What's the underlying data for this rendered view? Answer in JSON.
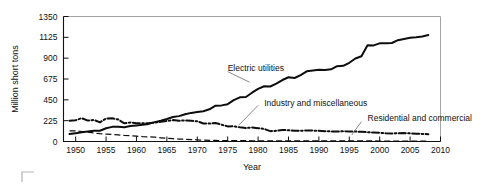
{
  "chart_data": {
    "type": "line",
    "title": "",
    "xlabel": "Year",
    "ylabel": "Million short tons",
    "xlim": [
      1948,
      2010
    ],
    "ylim": [
      0,
      1350
    ],
    "grid": false,
    "legend_position": "inline-annotations",
    "xticks": [
      1950,
      1955,
      1960,
      1965,
      1970,
      1975,
      1980,
      1985,
      1990,
      1995,
      2000,
      2005,
      2010
    ],
    "yticks": [
      0,
      225,
      450,
      675,
      900,
      1125,
      1350
    ],
    "xtick_labels": [
      "1950",
      "1955",
      "1960",
      "1965",
      "1970",
      "1975",
      "1980",
      "1985",
      "1990",
      "1995",
      "2000",
      "2005",
      "2010"
    ],
    "ytick_labels": [
      "0",
      "225",
      "450",
      "675",
      "900",
      "1125",
      "1350"
    ],
    "annotations": [
      {
        "text": "Electric utilities",
        "x": 1975,
        "y": 790
      },
      {
        "text": "Industry and miscellaneous",
        "x": 1981,
        "y": 420
      },
      {
        "text": "Residential and commercial",
        "x": 1998,
        "y": 250
      }
    ],
    "series": [
      {
        "name": "Electric utilities",
        "style": "solid",
        "x": [
          1949,
          1950,
          1951,
          1952,
          1953,
          1954,
          1955,
          1956,
          1957,
          1958,
          1959,
          1960,
          1961,
          1962,
          1963,
          1964,
          1965,
          1966,
          1967,
          1968,
          1969,
          1970,
          1971,
          1972,
          1973,
          1974,
          1975,
          1976,
          1977,
          1978,
          1979,
          1980,
          1981,
          1982,
          1983,
          1984,
          1985,
          1986,
          1987,
          1988,
          1989,
          1990,
          1991,
          1992,
          1993,
          1994,
          1995,
          1996,
          1997,
          1998,
          1999,
          2000,
          2001,
          2002,
          2003,
          2004,
          2005,
          2006,
          2007,
          2008
        ],
        "values": [
          80,
          90,
          100,
          108,
          117,
          116,
          143,
          158,
          160,
          153,
          167,
          174,
          180,
          190,
          209,
          224,
          243,
          264,
          274,
          294,
          309,
          318,
          327,
          348,
          387,
          390,
          403,
          447,
          477,
          481,
          527,
          569,
          597,
          594,
          625,
          664,
          694,
          686,
          717,
          758,
          767,
          774,
          772,
          780,
          813,
          817,
          850,
          896,
          921,
          1040,
          1038,
          1060,
          1060,
          1064,
          1094,
          1107,
          1120,
          1125,
          1135,
          1150
        ]
      },
      {
        "name": "Industry and miscellaneous",
        "style": "dash-dot",
        "x": [
          1949,
          1950,
          1951,
          1952,
          1953,
          1954,
          1955,
          1956,
          1957,
          1958,
          1959,
          1960,
          1961,
          1962,
          1963,
          1964,
          1965,
          1966,
          1967,
          1968,
          1969,
          1970,
          1971,
          1972,
          1973,
          1974,
          1975,
          1976,
          1977,
          1978,
          1979,
          1980,
          1981,
          1982,
          1983,
          1984,
          1985,
          1986,
          1987,
          1988,
          1989,
          1990,
          1991,
          1992,
          1993,
          1994,
          1995,
          1996,
          1997,
          1998,
          1999,
          2000,
          2001,
          2002,
          2003,
          2004,
          2005,
          2006,
          2007,
          2008
        ],
        "values": [
          224,
          230,
          252,
          226,
          233,
          207,
          248,
          250,
          238,
          196,
          206,
          198,
          196,
          196,
          205,
          212,
          222,
          231,
          223,
          228,
          223,
          218,
          195,
          194,
          199,
          182,
          163,
          165,
          153,
          145,
          152,
          144,
          136,
          112,
          115,
          124,
          122,
          115,
          116,
          120,
          118,
          115,
          111,
          109,
          108,
          110,
          108,
          107,
          105,
          100,
          97,
          95,
          88,
          87,
          89,
          91,
          88,
          85,
          82,
          78
        ]
      },
      {
        "name": "Residential and commercial",
        "style": "dashed",
        "x": [
          1949,
          1950,
          1951,
          1952,
          1953,
          1954,
          1955,
          1956,
          1957,
          1958,
          1959,
          1960,
          1961,
          1962,
          1963,
          1964,
          1965,
          1966,
          1967,
          1968,
          1969,
          1970,
          1971,
          1972,
          1973,
          1974,
          1975,
          1976,
          1977,
          1978,
          1979,
          1980,
          1981,
          1982,
          1983,
          1984,
          1985,
          1986,
          1987,
          1988,
          1989,
          1990,
          1991,
          1992,
          1993,
          1994,
          1995,
          1996,
          1997,
          1998,
          1999,
          2000,
          2001,
          2002,
          2003,
          2004,
          2005,
          2006,
          2007,
          2008
        ],
        "values": [
          115,
          114,
          108,
          100,
          92,
          84,
          80,
          76,
          72,
          65,
          62,
          58,
          53,
          50,
          46,
          40,
          34,
          30,
          26,
          24,
          21,
          18,
          15,
          13,
          11,
          10,
          9,
          9,
          9,
          9,
          8,
          7,
          7,
          6,
          6,
          6,
          6,
          6,
          6,
          6,
          6,
          6,
          6,
          6,
          6,
          6,
          6,
          6,
          6,
          6,
          6,
          5,
          5,
          5,
          5,
          5,
          5,
          5,
          5,
          5
        ]
      }
    ]
  },
  "footer": {
    "corner_mark": "crop-corner-mark"
  }
}
